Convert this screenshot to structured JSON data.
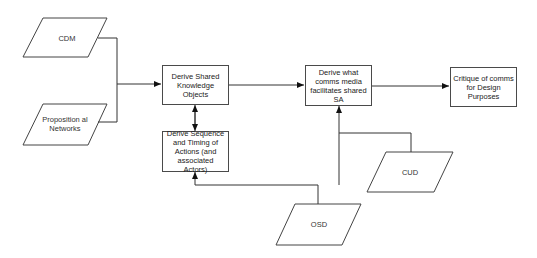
{
  "diagram": {
    "type": "flowchart",
    "inputs": [
      {
        "id": "cdm",
        "label": "CDM",
        "shape": "parallelogram"
      },
      {
        "id": "prop",
        "label": "Proposition al Networks",
        "shape": "parallelogram"
      },
      {
        "id": "osd",
        "label": "OSD",
        "shape": "parallelogram"
      },
      {
        "id": "cud",
        "label": "CUD",
        "shape": "parallelogram"
      }
    ],
    "processes": [
      {
        "id": "sko",
        "label": "Derive Shared Knowledge Objects"
      },
      {
        "id": "seq",
        "label": "Derive Sequence and Timing of Actions (and associated Actors)"
      },
      {
        "id": "comms",
        "label": "Derive what comms media facilitates shared SA"
      },
      {
        "id": "critique",
        "label": "Critique of comms for Design Purposes"
      }
    ],
    "edges": [
      {
        "from": "cdm",
        "to": "sko"
      },
      {
        "from": "prop",
        "to": "sko"
      },
      {
        "from": "sko",
        "to": "seq",
        "bidirectional": true
      },
      {
        "from": "sko",
        "to": "comms"
      },
      {
        "from": "comms",
        "to": "critique"
      },
      {
        "from": "cud",
        "to": "comms"
      },
      {
        "from": "osd",
        "to": "comms"
      },
      {
        "from": "osd",
        "to": "seq"
      }
    ]
  }
}
